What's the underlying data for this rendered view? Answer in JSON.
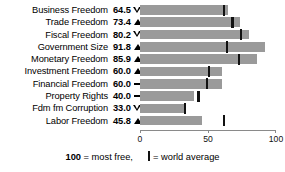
{
  "chart_data": {
    "type": "bar",
    "orientation": "horizontal",
    "title": "",
    "xlabel": "",
    "ylabel": "",
    "xlim": [
      0,
      100
    ],
    "grid": false,
    "categories": [
      "Business Freedom",
      "Trade Freedom",
      "Fiscal Freedom",
      "Government Size",
      "Monetary Freedom",
      "Investment Freedom",
      "Financial Freedom",
      "Property Rights",
      "Fdm fm Corruption",
      "Labor Freedom"
    ],
    "values": [
      64.5,
      73.4,
      80.2,
      91.8,
      85.9,
      60.0,
      60.0,
      40.0,
      33.0,
      45.8
    ],
    "value_labels": [
      "64.5",
      "73.4",
      "80.2",
      "91.8",
      "85.9",
      "60.0",
      "60.0",
      "40.0",
      "33.0",
      "45.8"
    ],
    "trend": [
      "down",
      "up",
      "down",
      "up",
      "up",
      "up",
      "flat",
      "flat",
      "down",
      "up"
    ],
    "trend_glyphs": [
      "▽",
      "▲",
      "▽",
      "▲",
      "▲",
      "▲",
      "—",
      "—",
      "▽",
      "▲"
    ],
    "series": [
      {
        "name": "score",
        "values": [
          64.5,
          73.4,
          80.2,
          91.8,
          85.9,
          60.0,
          60.0,
          40.0,
          33.0,
          45.8
        ]
      },
      {
        "name": "world average",
        "values": [
          62,
          68,
          74,
          64,
          73,
          51,
          49,
          43,
          33,
          62
        ]
      }
    ],
    "world_average": [
      62,
      68,
      74,
      64,
      73,
      51,
      49,
      43,
      33,
      62
    ],
    "xticks": [
      0,
      50,
      100
    ],
    "xtick_labels": [
      "0",
      "50",
      "100"
    ],
    "bar_color": "#9a9a9a",
    "marker_color": "#111111",
    "axis_color": "#8a8a8a"
  },
  "legend": {
    "scale_value": "100",
    "scale_text": "= most free,",
    "marker_text": "= world average"
  }
}
